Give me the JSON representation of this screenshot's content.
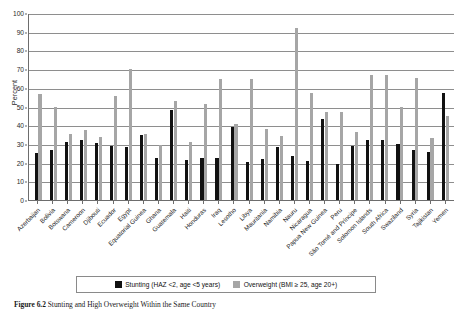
{
  "chart_data": {
    "type": "bar",
    "title": "",
    "xlabel": "",
    "ylabel": "Percent",
    "ylim": [
      0,
      100
    ],
    "ytick_step": 10,
    "yticks": [
      0,
      10,
      20,
      30,
      40,
      50,
      60,
      70,
      80,
      90,
      100
    ],
    "grid": true,
    "legend_position": "bottom-center",
    "categories": [
      "Azerbaijan",
      "Bolivia",
      "Botswana",
      "Cameroon",
      "Djibouti",
      "Ecuador",
      "Egypt",
      "Equatorial Guinea",
      "Ghana",
      "Guatemala",
      "Haiti",
      "Honduras",
      "Iraq",
      "Lesotho",
      "Libya",
      "Mauritania",
      "Namibia",
      "Nauru",
      "Nicaragua",
      "Papua New Guinea",
      "Peru",
      "São Tomé and Príncipe",
      "Solomon Islands",
      "South Africa",
      "Swaziland",
      "Syria",
      "Tajikistan",
      "Yemen"
    ],
    "series": [
      {
        "name": "Stunting (HAZ <2, age <5 years)",
        "key": "stunting",
        "color": "#111111",
        "values": [
          25,
          27,
          31,
          32,
          30.5,
          29,
          28.5,
          35,
          22.5,
          48,
          21.5,
          22.5,
          22.5,
          39,
          20.5,
          22,
          28.5,
          23.5,
          21,
          43.5,
          19.5,
          29,
          32,
          32,
          30,
          26.5,
          25.5,
          57
        ]
      },
      {
        "name": "Overweight (BMI ≥ 25, age 20+)",
        "key": "overweight",
        "color": "#a6a6a6",
        "values": [
          56.5,
          50,
          35.5,
          37.5,
          33.5,
          55.5,
          70,
          35.5,
          29.5,
          53,
          31,
          51.5,
          64.5,
          40.5,
          64.5,
          38,
          34,
          92,
          57,
          47,
          47,
          36.5,
          67,
          67,
          49.5,
          65,
          33,
          45
        ]
      }
    ]
  },
  "axis": {
    "y_title": "Percent"
  },
  "legend": {
    "entries": [
      {
        "label": "Stunting (HAZ <2, age <5 years)"
      },
      {
        "label": "Overweight (BMI ≥ 25, age 20+)"
      }
    ]
  },
  "caption": {
    "figure_label": "Figure 6.2",
    "text": "Stunting and High Overweight Within the Same Country"
  }
}
